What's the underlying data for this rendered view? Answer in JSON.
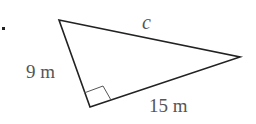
{
  "diagram": {
    "type": "right-triangle",
    "labels": {
      "hypotenuse": "c",
      "leg_left": "9 m",
      "leg_bottom": "15 m"
    },
    "right_angle_marker": true,
    "colors": {
      "stroke": "#222222",
      "label": "#555555"
    }
  }
}
